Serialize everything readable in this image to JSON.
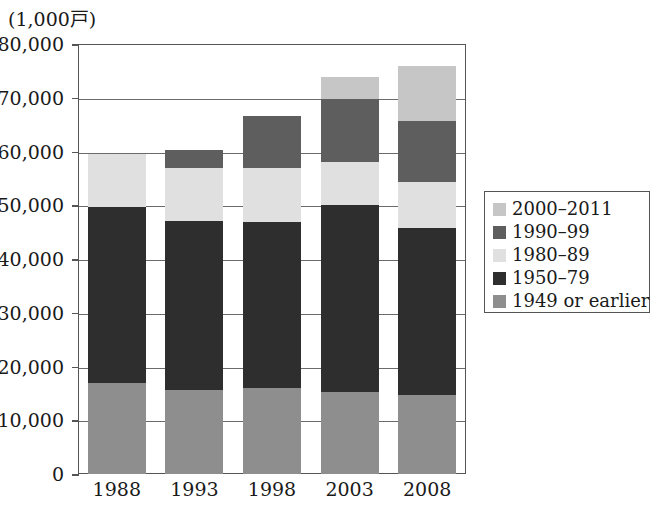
{
  "chart_data": {
    "type": "bar",
    "subtype": "stacked-vertical",
    "title": "",
    "unit_label": "(1,000戸)",
    "xlabel": "",
    "ylabel": "",
    "categories": [
      "1988",
      "1993",
      "1998",
      "2003",
      "2008"
    ],
    "ylim": [
      0,
      80000
    ],
    "ytick_values": [
      0,
      10000,
      20000,
      30000,
      40000,
      50000,
      60000,
      70000,
      80000
    ],
    "ytick_labels": [
      "0",
      "10,000",
      "20,000",
      "30,000",
      "40,000",
      "50,000",
      "60,000",
      "70,000",
      "80,000"
    ],
    "grid": true,
    "grid_axis": "y",
    "legend_position": "right",
    "stack_order_bottom_to_top": [
      "1949 or earlier",
      "1950–79",
      "1980–89",
      "1990–99",
      "2000–2011"
    ],
    "series": [
      {
        "name": "1949 or earlier",
        "color": "#8e8e8e",
        "values": [
          17000,
          15600,
          16000,
          15300,
          14700
        ]
      },
      {
        "name": "1950–79",
        "color": "#2e2e2e",
        "values": [
          32700,
          31500,
          30900,
          34800,
          31100
        ]
      },
      {
        "name": "1980–89",
        "color": "#e0e0e0",
        "values": [
          9800,
          9900,
          10100,
          8000,
          8600
        ]
      },
      {
        "name": "1990–99",
        "color": "#5e5e5e",
        "values": [
          0,
          3300,
          9700,
          11700,
          11200
        ]
      },
      {
        "name": "2000–2011",
        "color": "#c6c6c6",
        "values": [
          0,
          0,
          0,
          4100,
          10400
        ]
      }
    ],
    "totals": [
      59500,
      60300,
      66600,
      73900,
      75900
    ]
  },
  "legend": {
    "items": [
      {
        "label": "2000–2011",
        "color": "#c6c6c6"
      },
      {
        "label": "1990–99",
        "color": "#5e5e5e"
      },
      {
        "label": "1980–89",
        "color": "#e0e0e0"
      },
      {
        "label": "1950–79",
        "color": "#2e2e2e"
      },
      {
        "label": "1949 or earlier",
        "color": "#8e8e8e"
      }
    ]
  },
  "axis": {
    "unit": "(1,000戸)",
    "frame_color": "#555555",
    "gridline_color": "#6b6b6b"
  }
}
